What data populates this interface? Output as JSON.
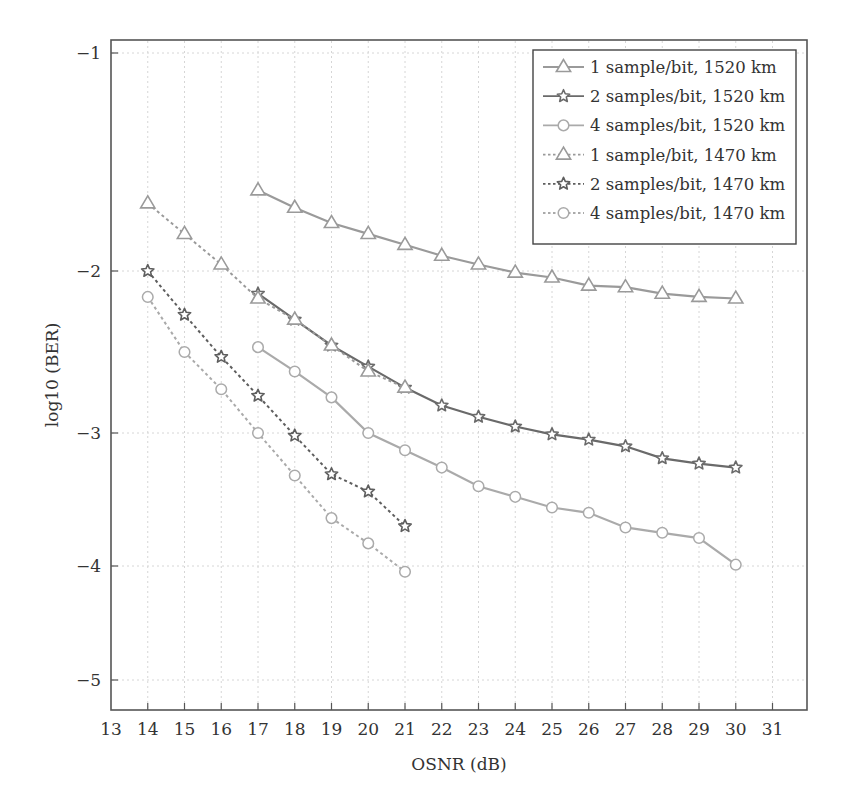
{
  "chart_data": {
    "type": "line",
    "title": "",
    "xlabel": "OSNR (dB)",
    "ylabel": "log10 (BER)",
    "xlim": [
      13,
      32
    ],
    "ylim": [
      -5.3,
      -0.9
    ],
    "x_ticks": [
      13,
      14,
      15,
      16,
      17,
      18,
      19,
      20,
      21,
      22,
      23,
      24,
      25,
      26,
      27,
      28,
      29,
      30,
      31
    ],
    "y_ticks": [
      -1,
      -2,
      -3,
      -4,
      -5
    ],
    "y_tick_labels": [
      "−1",
      "−2",
      "−3",
      "−4",
      "−5"
    ],
    "grid": true,
    "legend_position": "upper right",
    "series": [
      {
        "name": "1 sample/bit, 1520 km",
        "marker": "triangle",
        "line_style": "solid",
        "color": "#9a9a9a",
        "x": [
          17,
          18,
          19,
          20,
          21,
          22,
          23,
          24,
          25,
          26,
          27,
          28,
          29,
          30
        ],
        "values": [
          -1.63,
          -1.71,
          -1.78,
          -1.83,
          -1.88,
          -1.93,
          -1.97,
          -2.01,
          -2.04,
          -2.09,
          -2.1,
          -2.14,
          -2.16,
          -2.17
        ]
      },
      {
        "name": "2 samples/bit, 1520 km",
        "marker": "star",
        "line_style": "solid",
        "color": "#6a6a6a",
        "x": [
          17,
          18,
          19,
          20,
          21,
          22,
          23,
          24,
          25,
          26,
          27,
          28,
          29,
          30
        ],
        "values": [
          -2.14,
          -2.3,
          -2.46,
          -2.59,
          -2.72,
          -2.83,
          -2.9,
          -2.96,
          -3.01,
          -3.05,
          -3.1,
          -3.19,
          -3.23,
          -3.26
        ]
      },
      {
        "name": "4 samples/bit, 1520 km",
        "marker": "circle",
        "line_style": "solid",
        "color": "#aaaaaa",
        "x": [
          17,
          18,
          19,
          20,
          21,
          22,
          23,
          24,
          25,
          26,
          27,
          28,
          29,
          30
        ],
        "values": [
          -2.47,
          -2.62,
          -2.78,
          -3.0,
          -3.13,
          -3.26,
          -3.4,
          -3.48,
          -3.56,
          -3.6,
          -3.71,
          -3.75,
          -3.79,
          -3.99
        ]
      },
      {
        "name": "1 sample/bit, 1470 km",
        "marker": "triangle",
        "line_style": "dotted",
        "color": "#9a9a9a",
        "x": [
          14,
          15,
          16,
          17,
          18,
          19,
          20,
          21
        ],
        "values": [
          -1.69,
          -1.83,
          -1.97,
          -2.17,
          -2.3,
          -2.46,
          -2.62,
          -2.72
        ]
      },
      {
        "name": "2 samples/bit, 1470 km",
        "marker": "star",
        "line_style": "dotted",
        "color": "#5e5e5e",
        "x": [
          14,
          15,
          16,
          17,
          18,
          19,
          20,
          21
        ],
        "values": [
          -2.0,
          -2.27,
          -2.53,
          -2.77,
          -3.02,
          -3.31,
          -3.44,
          -3.7
        ]
      },
      {
        "name": "4 samples/bit, 1470 km",
        "marker": "circle",
        "line_style": "dotted",
        "color": "#aaaaaa",
        "x": [
          14,
          15,
          16,
          17,
          18,
          19,
          20,
          21
        ],
        "values": [
          -2.16,
          -2.5,
          -2.73,
          -3.0,
          -3.32,
          -3.64,
          -3.83,
          -4.05
        ]
      }
    ]
  }
}
